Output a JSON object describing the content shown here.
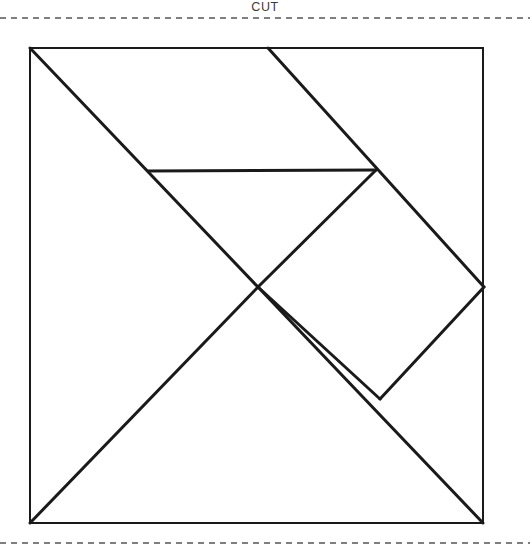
{
  "page": {
    "width": 530,
    "height": 550,
    "background_color": "#ffffff",
    "ink_color": "#1a1a1a",
    "dash_color": "#555555"
  },
  "labels": {
    "cut": {
      "text": "CUT",
      "x": 258,
      "y": 3
    }
  },
  "cut_lines": [
    {
      "name": "top-cut-line",
      "x1": 0,
      "y1": 18,
      "x2": 530,
      "y2": 18
    },
    {
      "name": "bottom-cut-line",
      "x1": 0,
      "y1": 543,
      "x2": 530,
      "y2": 543
    }
  ],
  "figure": {
    "type": "tangram-square",
    "square": {
      "left": 30,
      "top": 48,
      "right": 483,
      "bottom": 523
    },
    "border_width": 2,
    "cut_width": 3,
    "outline": [
      {
        "name": "square-top-edge",
        "x1": 30,
        "y1": 48,
        "x2": 483,
        "y2": 48
      },
      {
        "name": "square-right-edge",
        "x1": 483,
        "y1": 48,
        "x2": 483,
        "y2": 523
      },
      {
        "name": "square-bottom-edge",
        "x1": 483,
        "y1": 523,
        "x2": 30,
        "y2": 523
      },
      {
        "name": "square-left-edge",
        "x1": 30,
        "y1": 523,
        "x2": 30,
        "y2": 48
      }
    ],
    "cuts": [
      {
        "name": "main-diagonal",
        "x1": 30,
        "y1": 48,
        "x2": 483,
        "y2": 523
      },
      {
        "name": "upper-right-diagonal",
        "x1": 268,
        "y1": 48,
        "x2": 484,
        "y2": 287
      },
      {
        "name": "lower-left-diagonal",
        "x1": 258,
        "y1": 287,
        "x2": 30,
        "y2": 523
      },
      {
        "name": "horizontal-cut",
        "x1": 148,
        "y1": 171,
        "x2": 376,
        "y2": 170
      },
      {
        "name": "small-triangle-cut",
        "x1": 258,
        "y1": 287,
        "x2": 376,
        "y2": 170
      },
      {
        "name": "parallelogram-cut",
        "x1": 258,
        "y1": 287,
        "x2": 380,
        "y2": 399
      },
      {
        "name": "right-lower-diagonal",
        "x1": 484,
        "y1": 287,
        "x2": 380,
        "y2": 399
      }
    ],
    "vertices": [
      {
        "name": "top-left-corner",
        "x": 30,
        "y": 48
      },
      {
        "name": "top-right-corner",
        "x": 483,
        "y": 48
      },
      {
        "name": "bottom-right-corner",
        "x": 483,
        "y": 523
      },
      {
        "name": "bottom-left-corner",
        "x": 30,
        "y": 523
      },
      {
        "name": "top-midpoint",
        "x": 268,
        "y": 48
      },
      {
        "name": "center-crossing",
        "x": 258,
        "y": 287
      },
      {
        "name": "right-midpoint",
        "x": 484,
        "y": 287
      },
      {
        "name": "horizontal-left-end",
        "x": 148,
        "y": 171
      },
      {
        "name": "horizontal-right-end",
        "x": 376,
        "y": 170
      },
      {
        "name": "parallelogram-vertex",
        "x": 380,
        "y": 399
      }
    ]
  }
}
